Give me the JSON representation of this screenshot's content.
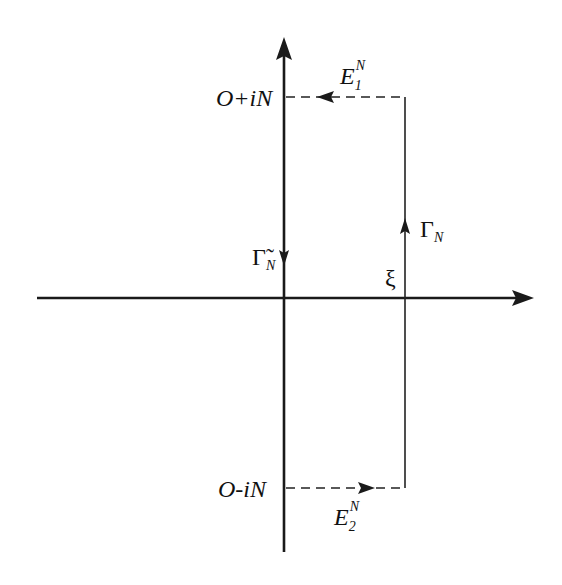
{
  "diagram": {
    "type": "complex-plane-contour",
    "labels": {
      "top_point": "O+iN",
      "bottom_point": "O-iN",
      "xi": "ξ",
      "gamma_n": "Γ",
      "gamma_n_sub": "N",
      "gamma_tilde": "Γ̃",
      "gamma_tilde_sub": "N",
      "e1": "E",
      "e1_sub": "1",
      "e1_sup": "N",
      "e2": "E",
      "e2_sub": "2",
      "e2_sup": "N"
    },
    "segments": [
      {
        "name": "E1N",
        "style": "dashed",
        "from": "ξ+iN",
        "to": "O+iN",
        "direction": "left"
      },
      {
        "name": "ΓN",
        "style": "solid",
        "from": "ξ-iN",
        "to": "ξ+iN",
        "direction": "up"
      },
      {
        "name": "E2N",
        "style": "dashed",
        "from": "O-iN",
        "to": "ξ-iN",
        "direction": "right"
      },
      {
        "name": "Γ̃N",
        "style": "solid",
        "from": "O+iN",
        "to": "O-iN",
        "direction": "down"
      }
    ]
  }
}
